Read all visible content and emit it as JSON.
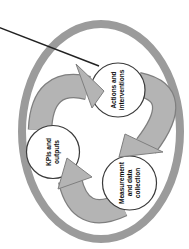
{
  "diagram": {
    "type": "cycle",
    "direction": "clockwise",
    "nodes": [
      {
        "id": "actions",
        "label": "Actions and\ninterventions"
      },
      {
        "id": "measurement",
        "label": "Measurement\nand data\ncollection"
      },
      {
        "id": "kpis",
        "label": "KPIs and\noutputs"
      }
    ],
    "flow": [
      "Actions and interventions -> Measurement and data collection",
      "Measurement and data collection -> KPIs and outputs",
      "KPIs and outputs -> Actions and interventions"
    ],
    "colors": {
      "background": "#ffffff",
      "ring": "#9b9b9b",
      "arrow_fill": "#b4b4b4",
      "arrow_outline": "#7f7f7f",
      "node_fill": "#ffffff",
      "node_outline": "#3a3a3a",
      "label_text": "#0f0f0f",
      "pointer_line": "#222222"
    }
  }
}
